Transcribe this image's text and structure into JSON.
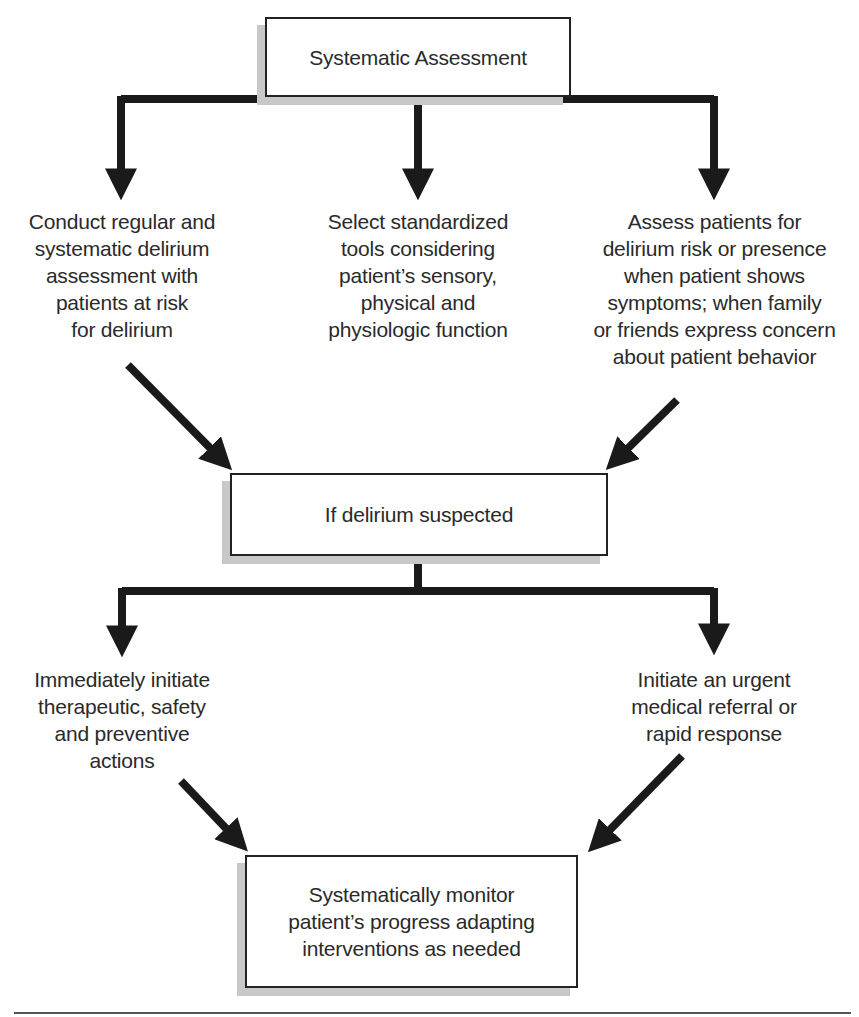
{
  "diagram": {
    "title_box": "Systematic Assessment",
    "branches_top": [
      {
        "text": "Conduct regular and\nsystematic delirium\nassessment with\npatients at risk\nfor delirium"
      },
      {
        "text": "Select standardized\ntools considering\npatient’s sensory,\nphysical and\nphysiologic function"
      },
      {
        "text": "Assess patients for\ndelirium risk or presence\nwhen patient shows\nsymptoms; when family\nor friends express concern\nabout patient behavior"
      }
    ],
    "decision_box": "If delirium suspected",
    "branches_bottom": [
      {
        "text": "Immediately initiate\ntherapeutic, safety\nand preventive\nactions"
      },
      {
        "text": "Initiate an urgent\nmedical referral or\nrapid response"
      }
    ],
    "final_box": "Systematically monitor\npatient’s progress adapting\ninterventions as needed",
    "colors": {
      "line": "#1a1a1a",
      "box_border": "#222222",
      "shadow": "#c8c8c8",
      "text": "#2a2a2a"
    }
  }
}
